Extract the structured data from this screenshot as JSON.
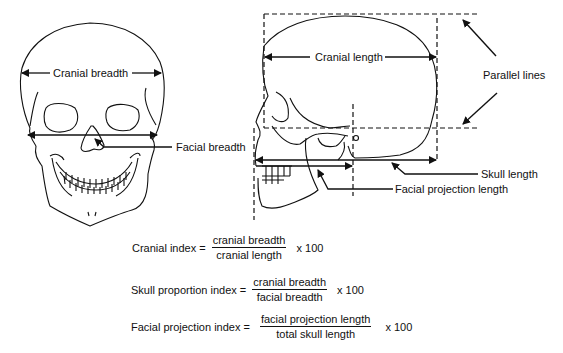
{
  "front_view": {
    "labels": {
      "cranial_breadth": "Cranial breadth",
      "facial_breadth": "Facial breadth"
    }
  },
  "lateral_view": {
    "labels": {
      "cranial_length": "Cranial length",
      "parallel_lines": "Parallel lines",
      "skull_length": "Skull length",
      "facial_projection_length": "Facial projection length"
    }
  },
  "formulas": [
    {
      "name": "Cranial index =",
      "numerator": "cranial breadth",
      "denominator": "cranial length",
      "multiplier": "x  100"
    },
    {
      "name": "Skull proportion index =",
      "numerator": "cranial breadth",
      "denominator": "facial breadth",
      "multiplier": "x  100"
    },
    {
      "name": "Facial projection index =",
      "numerator": "facial projection length",
      "denominator": "total skull length",
      "multiplier": "x  100"
    }
  ],
  "colors": {
    "ink": "#111111",
    "background": "#ffffff"
  }
}
